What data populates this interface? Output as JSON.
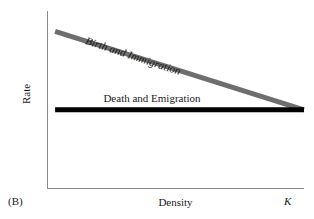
{
  "panel": {
    "label": "(B)"
  },
  "chart_data": {
    "type": "line",
    "title": "",
    "xlabel": "Density",
    "ylabel": "Rate",
    "grid": false,
    "legend_position": "inline-labels",
    "xlim": [
      0,
      1
    ],
    "ylim": [
      0,
      1
    ],
    "xticks": [
      {
        "value": 1.0,
        "label": "K",
        "style": "italic"
      }
    ],
    "yticks": [],
    "series": [
      {
        "name": "Birth and Immigration",
        "label_style": "italic",
        "label_rotation_deg": 18.3,
        "color": "#6e6e6e",
        "line_width_px": 5,
        "x": [
          0.02,
          1.0
        ],
        "y": [
          0.92,
          0.45
        ],
        "description": "density-dependent declining rate"
      },
      {
        "name": "Death and Emigration",
        "label_style": "roman",
        "label_rotation_deg": 0,
        "color": "#000000",
        "line_width_px": 5,
        "x": [
          0.02,
          1.0
        ],
        "y": [
          0.45,
          0.45
        ],
        "description": "density-independent constant rate"
      }
    ],
    "annotations": [
      {
        "name": "carrying-capacity-crossing",
        "text": "K",
        "x": 1.0,
        "y": 0.45
      }
    ],
    "colors": {
      "axis": "#8a8a8a",
      "birth_line": "#6e6e6e",
      "death_line": "#000000",
      "text": "#1a1a1a",
      "background": "#ffffff"
    }
  }
}
